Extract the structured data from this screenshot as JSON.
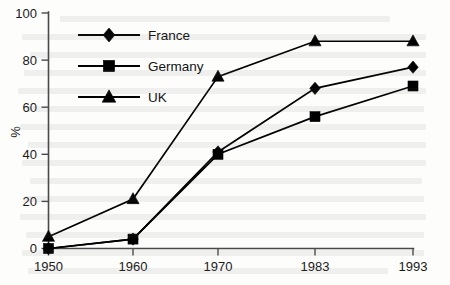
{
  "chart_data": {
    "type": "line",
    "title": "",
    "xlabel": "",
    "ylabel": "%",
    "categories": [
      "1950",
      "1960",
      "1970",
      "1983",
      "1993"
    ],
    "x_tick_labels": [
      "1950",
      "1960",
      "1970",
      "1983",
      "1993"
    ],
    "y_tick_labels": [
      "0",
      "20",
      "40",
      "60",
      "80",
      "100"
    ],
    "y_ticks": [
      0,
      20,
      40,
      60,
      80,
      100
    ],
    "ylim": [
      0,
      100
    ],
    "grid": false,
    "legend_position": "upper-left-inside",
    "series": [
      {
        "name": "France",
        "marker": "diamond",
        "color": "#000000",
        "values": [
          0,
          4,
          41,
          68,
          77
        ]
      },
      {
        "name": "Germany",
        "marker": "square",
        "color": "#000000",
        "values": [
          0,
          4,
          40,
          56,
          69
        ]
      },
      {
        "name": "UK",
        "marker": "triangle",
        "color": "#000000",
        "values": [
          5,
          21,
          73,
          88,
          88
        ]
      }
    ]
  },
  "legend": {
    "entries": [
      {
        "label": "France",
        "marker": "diamond"
      },
      {
        "label": "Germany",
        "marker": "square"
      },
      {
        "label": "UK",
        "marker": "triangle"
      }
    ]
  },
  "axes": {
    "y_axis_label": "%",
    "y_axis_label_rotation": "-90"
  }
}
